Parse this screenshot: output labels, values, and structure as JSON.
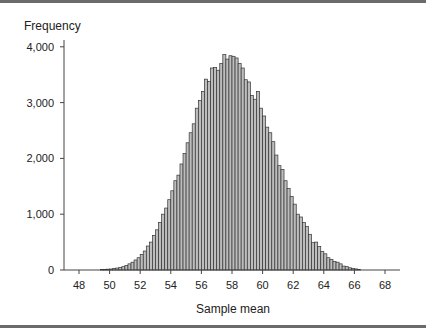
{
  "chart_data": {
    "type": "bar",
    "title": "",
    "xlabel": "Sample mean",
    "ylabel": "Frequency",
    "xlim": [
      47,
      69
    ],
    "ylim": [
      0,
      4000
    ],
    "grid": false,
    "legend": null,
    "bin_width": 0.2,
    "x_ticks": [
      48,
      50,
      52,
      54,
      56,
      58,
      60,
      62,
      64,
      66,
      68
    ],
    "x_tick_labels": [
      "48",
      "50",
      "52",
      "54",
      "56",
      "58",
      "60",
      "62",
      "64",
      "66",
      "68"
    ],
    "y_ticks": [
      0,
      1000,
      2000,
      3000,
      4000
    ],
    "y_tick_labels": [
      "0",
      "1,000",
      "2,000",
      "3,000",
      "4,000"
    ],
    "bar_color": "#bdbdbd",
    "bar_edge_color": "#333333",
    "x": [
      49.5,
      49.7,
      49.9,
      50.1,
      50.3,
      50.5,
      50.7,
      50.9,
      51.1,
      51.3,
      51.5,
      51.7,
      51.9,
      52.1,
      52.3,
      52.5,
      52.7,
      52.9,
      53.1,
      53.3,
      53.5,
      53.7,
      53.9,
      54.1,
      54.3,
      54.5,
      54.7,
      54.9,
      55.1,
      55.3,
      55.5,
      55.7,
      55.9,
      56.1,
      56.3,
      56.5,
      56.7,
      56.9,
      57.1,
      57.3,
      57.5,
      57.7,
      57.9,
      58.1,
      58.3,
      58.5,
      58.7,
      58.9,
      59.1,
      59.3,
      59.5,
      59.7,
      59.9,
      60.1,
      60.3,
      60.5,
      60.7,
      60.9,
      61.1,
      61.3,
      61.5,
      61.7,
      61.9,
      62.1,
      62.3,
      62.5,
      62.7,
      62.9,
      63.1,
      63.3,
      63.5,
      63.7,
      63.9,
      64.1,
      64.3,
      64.5,
      64.7,
      64.9,
      65.1,
      65.3,
      65.5,
      65.7,
      65.9,
      66.1,
      66.3
    ],
    "values": [
      10,
      12,
      15,
      18,
      25,
      35,
      45,
      60,
      80,
      110,
      140,
      180,
      220,
      280,
      340,
      430,
      500,
      620,
      720,
      850,
      1000,
      1110,
      1260,
      1420,
      1600,
      1700,
      1900,
      2090,
      2280,
      2460,
      2620,
      2900,
      3040,
      3200,
      3420,
      3380,
      3620,
      3630,
      3580,
      3700,
      3860,
      3780,
      3840,
      3830,
      3800,
      3700,
      3620,
      3410,
      3370,
      3130,
      3060,
      3200,
      2900,
      2760,
      2560,
      2460,
      2300,
      2060,
      1870,
      1800,
      1600,
      1460,
      1320,
      1180,
      1000,
      950,
      850,
      780,
      640,
      490,
      500,
      420,
      330,
      290,
      220,
      190,
      150,
      140,
      110,
      70,
      60,
      40,
      30,
      20,
      10
    ]
  }
}
